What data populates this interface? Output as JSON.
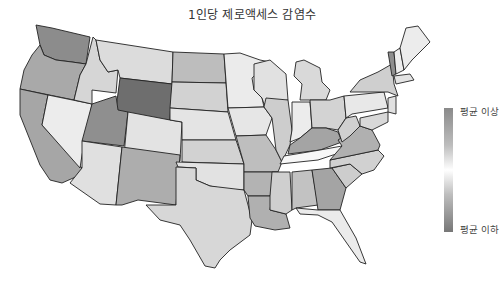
{
  "chart_data": {
    "type": "choropleth",
    "title": "1인당 제로액세스 감염수",
    "region": "United States (contiguous)",
    "color_scale": {
      "top_label": "평균 이상",
      "bottom_label": "평균 이하",
      "colors": [
        "#8a8a8a",
        "#bdbdbd",
        "#ffffff",
        "#bdbdbd",
        "#777777"
      ]
    },
    "states": [
      {
        "id": "WA",
        "shade": "#8c8c8c"
      },
      {
        "id": "OR",
        "shade": "#a9a9a9"
      },
      {
        "id": "CA",
        "shade": "#a6a6a6"
      },
      {
        "id": "NV",
        "shade": "#ececec"
      },
      {
        "id": "ID",
        "shade": "#d6d6d6"
      },
      {
        "id": "MT",
        "shade": "#dcdcdc"
      },
      {
        "id": "WY",
        "shade": "#6e6e6e"
      },
      {
        "id": "UT",
        "shade": "#8f8f8f"
      },
      {
        "id": "CO",
        "shade": "#e3e3e3"
      },
      {
        "id": "AZ",
        "shade": "#e0e0e0"
      },
      {
        "id": "NM",
        "shade": "#adadad"
      },
      {
        "id": "ND",
        "shade": "#bdbdbd"
      },
      {
        "id": "SD",
        "shade": "#d2d2d2"
      },
      {
        "id": "NE",
        "shade": "#e4e4e4"
      },
      {
        "id": "KS",
        "shade": "#d2d2d2"
      },
      {
        "id": "OK",
        "shade": "#e2e2e2"
      },
      {
        "id": "TX",
        "shade": "#d7d7d7"
      },
      {
        "id": "MN",
        "shade": "#ebebeb"
      },
      {
        "id": "IA",
        "shade": "#e6e6e6"
      },
      {
        "id": "MO",
        "shade": "#bebebe"
      },
      {
        "id": "AR",
        "shade": "#b3b3b3"
      },
      {
        "id": "LA",
        "shade": "#b0b0b0"
      },
      {
        "id": "WI",
        "shade": "#e1e1e1"
      },
      {
        "id": "IL",
        "shade": "#cdcdcd"
      },
      {
        "id": "MI",
        "shade": "#d9d9d9"
      },
      {
        "id": "IN",
        "shade": "#ececec"
      },
      {
        "id": "OH",
        "shade": "#d3d3d3"
      },
      {
        "id": "KY",
        "shade": "#a4a4a4"
      },
      {
        "id": "TN",
        "shade": "#f7f7f7"
      },
      {
        "id": "MS",
        "shade": "#cfcfcf"
      },
      {
        "id": "AL",
        "shade": "#c2c2c2"
      },
      {
        "id": "GA",
        "shade": "#a4a4a4"
      },
      {
        "id": "FL",
        "shade": "#ebebeb"
      },
      {
        "id": "SC",
        "shade": "#cdcdcd"
      },
      {
        "id": "NC",
        "shade": "#d1d1d1"
      },
      {
        "id": "VA",
        "shade": "#b0b0b0"
      },
      {
        "id": "WV",
        "shade": "#d0d0d0"
      },
      {
        "id": "PA",
        "shade": "#e8e8e8"
      },
      {
        "id": "NY",
        "shade": "#cfcfcf"
      },
      {
        "id": "VT",
        "shade": "#8e8e8e"
      },
      {
        "id": "NH",
        "shade": "#eeeeee"
      },
      {
        "id": "ME",
        "shade": "#ececec"
      },
      {
        "id": "MA",
        "shade": "#e3e3e3"
      },
      {
        "id": "NJ",
        "shade": "#e0e0e0"
      },
      {
        "id": "MD",
        "shade": "#d8d8d8"
      }
    ]
  }
}
